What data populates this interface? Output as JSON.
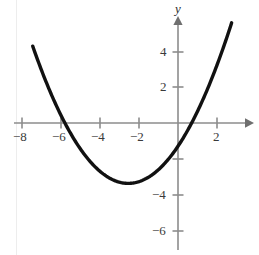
{
  "chart_data": {
    "type": "line",
    "title": "",
    "subtitle": "",
    "xlabel": "",
    "ylabel": "y",
    "axis_labels": {
      "y_axis_name": "y",
      "x_axis_name": ""
    },
    "xlim": [
      -8.6,
      3.8
    ],
    "ylim": [
      -7.1,
      5.6
    ],
    "grid": false,
    "legend": null,
    "x_ticks": [
      -8,
      -6,
      -4,
      -2,
      2
    ],
    "x_tick_labels": [
      "−8",
      "−6",
      "−4",
      "−2",
      "2"
    ],
    "y_ticks": [
      4,
      2,
      -2,
      -4,
      -6
    ],
    "y_tick_labels": [
      "4",
      "2",
      "",
      "−4",
      "−6"
    ],
    "series": [
      {
        "name": "parabola",
        "color": "#111111",
        "linewidth": 3.4,
        "equation_form": "y = a(x - h)^2 + k",
        "vertex": [
          -2.55,
          -3.4
        ],
        "x_intercepts": [
          -5.8,
          0.7
        ],
        "y_intercept": -2.2,
        "x_domain": [
          -7.45,
          2.75
        ],
        "points": [
          {
            "x": -7.45,
            "y": 5.4
          },
          {
            "x": -7.0,
            "y": 3.8
          },
          {
            "x": -6.5,
            "y": 2.2
          },
          {
            "x": -6.0,
            "y": 0.75
          },
          {
            "x": -5.8,
            "y": 0.0
          },
          {
            "x": -5.5,
            "y": -0.55
          },
          {
            "x": -5.0,
            "y": -1.55
          },
          {
            "x": -4.5,
            "y": -2.3
          },
          {
            "x": -4.0,
            "y": -2.85
          },
          {
            "x": -3.5,
            "y": -3.2
          },
          {
            "x": -3.0,
            "y": -3.38
          },
          {
            "x": -2.55,
            "y": -3.4
          },
          {
            "x": -2.0,
            "y": -3.25
          },
          {
            "x": -1.5,
            "y": -2.95
          },
          {
            "x": -1.0,
            "y": -2.45
          },
          {
            "x": -0.5,
            "y": -1.8
          },
          {
            "x": 0.0,
            "y": -2.2
          },
          {
            "x": 0.3,
            "y": -0.75
          },
          {
            "x": 0.7,
            "y": 0.0
          },
          {
            "x": 1.0,
            "y": 0.85
          },
          {
            "x": 1.5,
            "y": 2.1
          },
          {
            "x": 2.0,
            "y": 3.5
          },
          {
            "x": 2.4,
            "y": 4.6
          },
          {
            "x": 2.75,
            "y": 5.45
          }
        ]
      }
    ],
    "axis_style": {
      "axis_color": "#8c8c8c",
      "tick_color": "#8c8c8c",
      "curve_color": "#111111",
      "background": "#ffffff",
      "x_axis_arrow": true,
      "y_axis_arrow": true
    }
  }
}
